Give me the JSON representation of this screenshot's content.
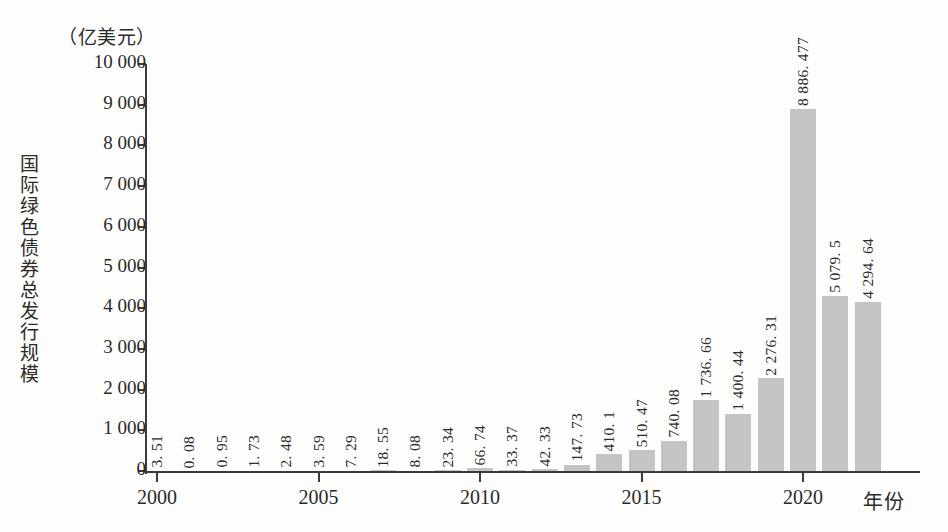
{
  "chart_data": {
    "type": "bar",
    "title": "",
    "unit_caption": "（亿美元）",
    "ylabel": "国际绿色债券总发行规模",
    "xlabel": "年份",
    "ylim": [
      0,
      10000
    ],
    "ytick_values": [
      0,
      1000,
      2000,
      3000,
      4000,
      5000,
      6000,
      7000,
      8000,
      9000,
      10000
    ],
    "ytick_labels": [
      "0",
      "1 000",
      "2 000",
      "3 000",
      "4 000",
      "5 000",
      "6 000",
      "7 000",
      "8 000",
      "9 000",
      "10 000"
    ],
    "xtick_years": [
      2000,
      2005,
      2010,
      2015,
      2020
    ],
    "xtick_labels": [
      "2000",
      "2005",
      "2010",
      "2015",
      "2020"
    ],
    "grid": false,
    "legend": null,
    "bar_color": "#c4c4c4",
    "axis_color": "#3b3b3b",
    "categories": [
      2000,
      2001,
      2002,
      2003,
      2004,
      2005,
      2006,
      2007,
      2008,
      2009,
      2010,
      2011,
      2012,
      2013,
      2014,
      2015,
      2016,
      2017,
      2018,
      2019,
      2020,
      2021,
      2022
    ],
    "values": [
      3.51,
      0.08,
      0.95,
      1.73,
      2.48,
      3.59,
      7.29,
      18.55,
      8.08,
      23.34,
      66.74,
      33.37,
      42.33,
      147.73,
      410.1,
      510.47,
      740.08,
      1736.66,
      1400.44,
      2276.31,
      8886.477,
      4294.64,
      4159.47
    ],
    "value_labels": [
      "3. 51",
      "0. 08",
      "0. 95",
      "1. 73",
      "2. 48",
      "3. 59",
      "7. 29",
      "18. 55",
      "8. 08",
      "23. 34",
      "66. 74",
      "33. 37",
      "42. 33",
      "147. 73",
      "410. 1",
      "510. 47",
      "740. 08",
      "1 736. 66",
      "1 400. 44",
      "2 276. 31",
      "8 886. 477",
      "5 079. 5",
      "4 294. 64",
      "4 159. 47"
    ]
  }
}
